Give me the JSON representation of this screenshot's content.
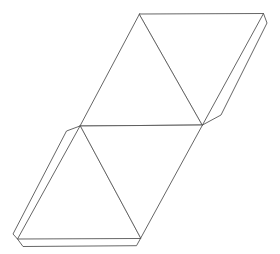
{
  "diagram": {
    "type": "tetrahedron-net",
    "stroke_color": "#555555",
    "background": "#ffffff",
    "vertices": {
      "A": [
        139.5,
        14
      ],
      "B": [
        263.5,
        13.5
      ],
      "C": [
        202.5,
        125
      ],
      "D": [
        80,
        126
      ],
      "E": [
        17.5,
        239
      ],
      "F": [
        140.5,
        238.5
      ]
    },
    "faces": [
      {
        "name": "face-top-left",
        "points": "139.5,14 80,126 202.5,125"
      },
      {
        "name": "face-top-right",
        "points": "139.5,14 263.5,13.5 202.5,125"
      },
      {
        "name": "face-bottom-right",
        "points": "80,126 202.5,125 140.5,238.5"
      },
      {
        "name": "face-bottom-left",
        "points": "80,126 17.5,239 140.5,238.5"
      }
    ],
    "tabs": [
      {
        "name": "glue-tab-right",
        "points": "263.5,13.5 267,23 221,115 202.5,125"
      },
      {
        "name": "glue-tab-left",
        "points": "80,126 66.5,131 13,234 17.5,239"
      },
      {
        "name": "glue-tab-bottom",
        "points": "17.5,239 23,246.5 136.5,245.7 140.5,238.5"
      }
    ]
  }
}
